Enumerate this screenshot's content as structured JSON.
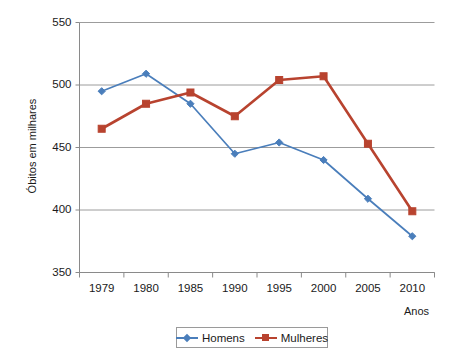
{
  "chart_data": {
    "type": "line",
    "title": "",
    "xlabel": "Anos",
    "ylabel": "Óbitos em milhares",
    "categories": [
      "1979",
      "1980",
      "1985",
      "1990",
      "1995",
      "2000",
      "2005",
      "2010"
    ],
    "series": [
      {
        "name": "Homens",
        "color": "#4a7ebb",
        "marker": "diamond",
        "values": [
          495,
          509,
          485,
          445,
          454,
          440,
          409,
          379
        ]
      },
      {
        "name": "Mulheres",
        "color": "#b8432f",
        "marker": "square",
        "values": [
          465,
          485,
          494,
          475,
          504,
          507,
          453,
          399
        ]
      }
    ],
    "ylim": [
      350,
      550
    ],
    "yticks": [
      350,
      400,
      450,
      500,
      550
    ],
    "ytick_labels": [
      "350",
      "400",
      "450",
      "500",
      "550"
    ],
    "grid": "horizontal",
    "legend_position": "bottom"
  },
  "legend": {
    "entries": [
      {
        "label": "Homens"
      },
      {
        "label": "Mulheres"
      }
    ]
  },
  "axes": {
    "y_title": "Óbitos em milhares",
    "x_title": "Anos"
  }
}
